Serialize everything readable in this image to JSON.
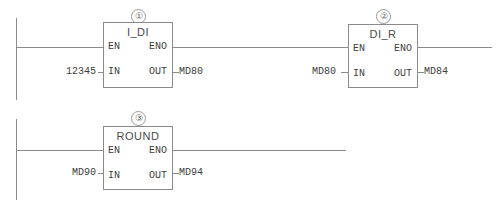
{
  "diagram": {
    "line_color": "#8a8a8a",
    "text_color": "#3d3d3d",
    "background": "#ffffff"
  },
  "pin_labels": {
    "en": "EN",
    "eno": "ENO",
    "in": "IN",
    "out": "OUT"
  },
  "networks": [
    {
      "index_marker": "①",
      "block_name": "I_DI",
      "input_operand": "12345",
      "output_operand": "MD80"
    },
    {
      "index_marker": "②",
      "block_name": "DI_R",
      "input_operand": "MD80",
      "output_operand": "MD84"
    },
    {
      "index_marker": "③",
      "block_name": "ROUND",
      "input_operand": "MD90",
      "output_operand": "MD94"
    }
  ]
}
